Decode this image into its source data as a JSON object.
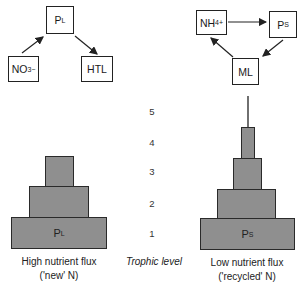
{
  "left_network": {
    "producer": {
      "main": "P",
      "sub": "L"
    },
    "nutrient": {
      "main": "NO",
      "sub": "3",
      "sup": "−"
    },
    "consumer": {
      "main": "HTL"
    }
  },
  "right_network": {
    "nutrient": {
      "main": "NH",
      "sub": "4",
      "sup": "+"
    },
    "producer": {
      "main": "P",
      "sub": "S"
    },
    "consumer": {
      "main": "ML"
    }
  },
  "left_pyramid": {
    "base_label": {
      "main": "P",
      "sub": "L"
    },
    "levels": 3,
    "caption_line1": "High nutrient flux",
    "caption_line2": "('new' N)"
  },
  "right_pyramid": {
    "base_label": {
      "main": "P",
      "sub": "S"
    },
    "levels": 5,
    "caption_line1": "Low nutrient flux",
    "caption_line2": "('recycled' N)"
  },
  "trophic_axis": {
    "title": "Trophic level",
    "levels": [
      "5",
      "4",
      "3",
      "2",
      "1"
    ]
  },
  "colors": {
    "layer_fill": "#8f8f8f",
    "stroke": "#222222"
  }
}
